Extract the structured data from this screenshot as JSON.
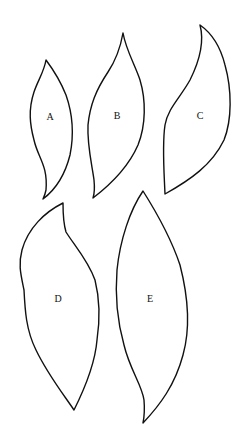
{
  "figure": {
    "shapes": [
      {
        "id": "A",
        "label": "A",
        "label_pos": [
          50,
          118
        ]
      },
      {
        "id": "B",
        "label": "B",
        "label_pos": [
          117,
          117
        ]
      },
      {
        "id": "C",
        "label": "C",
        "label_pos": [
          200,
          117
        ]
      },
      {
        "id": "D",
        "label": "D",
        "label_pos": [
          58,
          300
        ]
      },
      {
        "id": "E",
        "label": "E",
        "label_pos": [
          150,
          300
        ]
      }
    ],
    "colors": {
      "stroke": "#111111",
      "background": "#ffffff"
    }
  }
}
